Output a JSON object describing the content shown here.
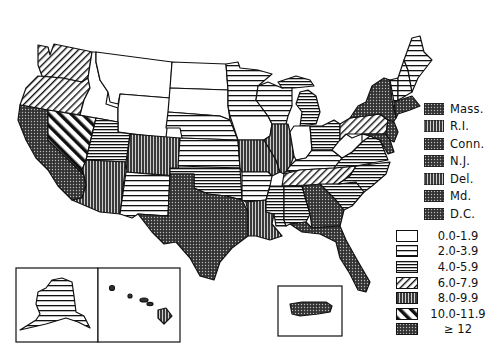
{
  "map": {
    "type": "choropleth",
    "region": "United States",
    "insets": [
      "Alaska",
      "Hawaii",
      "Puerto Rico"
    ]
  },
  "legend_classes": [
    {
      "id": "c0",
      "label": "0.0-1.9",
      "pattern": "blank"
    },
    {
      "id": "c1",
      "label": "2.0-3.9",
      "pattern": "wide-horizontal-lines"
    },
    {
      "id": "c2",
      "label": "4.0-5.9",
      "pattern": "dense-horizontal-lines"
    },
    {
      "id": "c3",
      "label": "6.0-7.9",
      "pattern": "diagonal-lines"
    },
    {
      "id": "c4",
      "label": "8.0-9.9",
      "pattern": "dark-vertical-lines"
    },
    {
      "id": "c5",
      "label": "10.0-11.9",
      "pattern": "wide-diagonal-bands"
    },
    {
      "id": "c6",
      "label": "≥ 12",
      "pattern": "dark-dotted"
    }
  ],
  "small_states_legend": [
    {
      "label": "Mass.",
      "class": "c6"
    },
    {
      "label": "R.I.",
      "class": "c4"
    },
    {
      "label": "Conn.",
      "class": "c6"
    },
    {
      "label": "N.J.",
      "class": "c6"
    },
    {
      "label": "Del.",
      "class": "c4"
    },
    {
      "label": "Md.",
      "class": "c6"
    },
    {
      "label": "D.C.",
      "class": "c6"
    }
  ],
  "states": {
    "WA": "c3",
    "OR": "c3",
    "CA": "c6",
    "NV": "c5",
    "ID": "c0",
    "MT": "c0",
    "WY": "c0",
    "UT": "c2",
    "AZ": "c4",
    "CO": "c4",
    "NM": "c1",
    "ND": "c0",
    "SD": "c0",
    "NE": "c1",
    "KS": "c1",
    "OK": "c2",
    "TX": "c6",
    "MN": "c1",
    "IA": "c0",
    "MO": "c4",
    "AR": "c1",
    "LA": "c4",
    "WI": "c1",
    "IL": "c4",
    "MI": "c2",
    "IN": "c0",
    "OH": "c2",
    "KY": "c1",
    "TN": "c3",
    "MS": "c2",
    "AL": "c2",
    "GA": "c6",
    "FL": "c6",
    "SC": "c2",
    "NC": "c2",
    "VA": "c2",
    "WV": "c0",
    "PA": "c3",
    "NY": "c6",
    "VT": "c1",
    "NH": "c1",
    "ME": "c1",
    "AK": "c1",
    "HI": "c4",
    "PR": "c6"
  }
}
